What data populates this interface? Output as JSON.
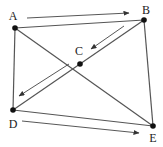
{
  "diagram": {
    "type": "graph",
    "nodes": [
      {
        "id": "A",
        "label": "A",
        "x": 15,
        "y": 28,
        "label_x": 13,
        "label_y": 20
      },
      {
        "id": "B",
        "label": "B",
        "x": 144,
        "y": 20,
        "label_x": 146,
        "label_y": 14
      },
      {
        "id": "C",
        "label": "C",
        "x": 80,
        "y": 64,
        "label_x": 79,
        "label_y": 55
      },
      {
        "id": "D",
        "label": "D",
        "x": 13,
        "y": 110,
        "label_x": 13,
        "label_y": 128
      },
      {
        "id": "E",
        "label": "E",
        "x": 153,
        "y": 126,
        "label_x": 153,
        "label_y": 142
      }
    ],
    "edges": [
      {
        "from": "A",
        "to": "B"
      },
      {
        "from": "A",
        "to": "D"
      },
      {
        "from": "A",
        "to": "E"
      },
      {
        "from": "B",
        "to": "D"
      },
      {
        "from": "B",
        "to": "E"
      },
      {
        "from": "D",
        "to": "E"
      }
    ],
    "arrows": [
      {
        "name": "arrow-a-to-b",
        "from": "A",
        "to": "B",
        "x1": 27,
        "y1": 18,
        "x2": 129,
        "y2": 13
      },
      {
        "name": "arrow-b-to-c",
        "from": "B",
        "to": "C",
        "x1": 124,
        "y1": 26,
        "x2": 91,
        "y2": 49
      },
      {
        "name": "arrow-c-to-d",
        "from": "C",
        "to": "D",
        "x1": 69,
        "y1": 64,
        "x2": 19,
        "y2": 96
      },
      {
        "name": "arrow-d-to-e",
        "from": "D",
        "to": "E",
        "x1": 22,
        "y1": 121,
        "x2": 139,
        "y2": 133
      }
    ],
    "colors": {
      "edge": "#555555",
      "arrow": "#444444",
      "node": "#111111",
      "label": "#222222"
    }
  }
}
